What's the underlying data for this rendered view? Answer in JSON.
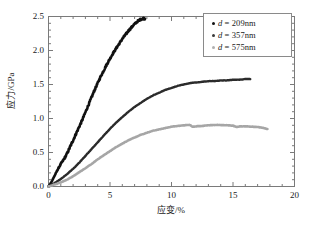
{
  "chart_data": {
    "type": "line",
    "title": "",
    "xlabel": "应变/%",
    "ylabel": "应力/GPa",
    "xlim": [
      0,
      20
    ],
    "ylim": [
      0.0,
      2.5
    ],
    "xticks": [
      "0",
      "5",
      "10",
      "15",
      "20"
    ],
    "xtick_values": [
      0,
      5,
      10,
      15,
      20
    ],
    "yticks": [
      "0.0",
      "0.5",
      "1.0",
      "1.5",
      "2.0",
      "2.5"
    ],
    "ytick_values": [
      0.0,
      0.5,
      1.0,
      1.5,
      2.0,
      2.5
    ],
    "xminor_step": 1,
    "yminor_step": 0.1,
    "grid": false,
    "legend_position": "upper-right",
    "series": [
      {
        "name": "d = 209nm",
        "label_prefix": "d",
        "label_value": "209nm",
        "color": "#111111",
        "marker": "dot",
        "linewidth": 2.6,
        "noisy": true,
        "x": [
          0.0,
          0.25,
          0.5,
          0.75,
          1.0,
          1.25,
          1.5,
          1.75,
          2.0,
          2.25,
          2.5,
          2.75,
          3.0,
          3.25,
          3.5,
          3.75,
          4.0,
          4.25,
          4.5,
          4.75,
          5.0,
          5.25,
          5.5,
          5.75,
          6.0,
          6.25,
          6.5,
          6.75,
          7.0,
          7.25,
          7.5,
          7.7,
          7.85
        ],
        "y": [
          0.0,
          0.07,
          0.16,
          0.25,
          0.33,
          0.4,
          0.48,
          0.58,
          0.68,
          0.78,
          0.88,
          0.98,
          1.09,
          1.2,
          1.31,
          1.42,
          1.52,
          1.62,
          1.71,
          1.8,
          1.88,
          1.96,
          2.03,
          2.1,
          2.17,
          2.23,
          2.29,
          2.34,
          2.39,
          2.43,
          2.46,
          2.47,
          2.47
        ]
      },
      {
        "name": "d = 357nm",
        "label_prefix": "d",
        "label_value": "357nm",
        "color": "#2b2b2b",
        "marker": "dot",
        "linewidth": 2.4,
        "noisy": false,
        "x": [
          0.0,
          0.5,
          1.0,
          1.5,
          2.0,
          2.5,
          3.0,
          3.5,
          4.0,
          4.5,
          5.0,
          5.5,
          6.0,
          6.5,
          7.0,
          7.5,
          8.0,
          8.5,
          9.0,
          9.5,
          10.0,
          10.5,
          11.0,
          11.5,
          12.0,
          12.5,
          13.0,
          13.5,
          14.0,
          14.5,
          15.0,
          15.5,
          16.0,
          16.4
        ],
        "y": [
          0.0,
          0.05,
          0.11,
          0.18,
          0.26,
          0.35,
          0.45,
          0.55,
          0.65,
          0.75,
          0.85,
          0.94,
          1.02,
          1.1,
          1.17,
          1.23,
          1.29,
          1.34,
          1.38,
          1.42,
          1.45,
          1.48,
          1.5,
          1.52,
          1.53,
          1.54,
          1.55,
          1.55,
          1.56,
          1.56,
          1.57,
          1.57,
          1.58,
          1.58
        ]
      },
      {
        "name": "d = 575nm",
        "label_prefix": "d",
        "label_value": "575nm",
        "color": "#a6a6a6",
        "marker": "dot",
        "linewidth": 2.6,
        "noisy": false,
        "x": [
          0.0,
          0.5,
          1.0,
          1.5,
          2.0,
          2.5,
          3.0,
          3.5,
          4.0,
          4.5,
          5.0,
          5.5,
          6.0,
          6.5,
          7.0,
          7.5,
          8.0,
          8.5,
          9.0,
          9.5,
          10.0,
          10.5,
          11.0,
          11.5,
          11.7,
          12.0,
          12.5,
          13.0,
          13.5,
          14.0,
          14.5,
          15.0,
          15.3,
          15.6,
          16.0,
          16.5,
          17.0,
          17.4,
          17.8
        ],
        "y": [
          0.0,
          0.03,
          0.06,
          0.1,
          0.15,
          0.21,
          0.27,
          0.33,
          0.4,
          0.46,
          0.52,
          0.58,
          0.63,
          0.68,
          0.72,
          0.76,
          0.79,
          0.82,
          0.84,
          0.86,
          0.88,
          0.89,
          0.9,
          0.905,
          0.88,
          0.885,
          0.89,
          0.9,
          0.905,
          0.905,
          0.9,
          0.895,
          0.875,
          0.885,
          0.885,
          0.88,
          0.875,
          0.865,
          0.845
        ]
      }
    ]
  },
  "axes": {
    "frame_color": "#7a7a7a",
    "tick_color": "#7a7a7a",
    "background": "#ffffff"
  },
  "legend": {
    "items": [
      {
        "text": "209nm",
        "symbol": "d",
        "equals": "=",
        "color": "#111111"
      },
      {
        "text": "357nm",
        "symbol": "d",
        "equals": "=",
        "color": "#3a3a3a"
      },
      {
        "text": "575nm",
        "symbol": "d",
        "equals": "=",
        "color": "#b0b0b0"
      }
    ]
  }
}
